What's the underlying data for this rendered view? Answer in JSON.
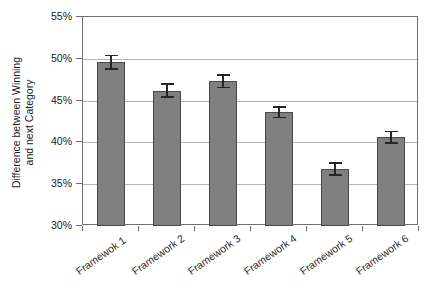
{
  "chart_data": {
    "type": "bar",
    "title": "",
    "subtitle": "",
    "xlabel": "",
    "ylabel": "Difference between Winning and next Category",
    "ylabel_lines": [
      "Difference between Winning",
      "and next Category"
    ],
    "categories": [
      "Framewok 1",
      "Framework 2",
      "Framework 3",
      "Framework 4",
      "Framework 5",
      "Framework 6"
    ],
    "values": [
      49.6,
      46.2,
      47.3,
      43.6,
      36.8,
      40.6
    ],
    "errors": [
      0.9,
      0.9,
      0.85,
      0.7,
      0.8,
      0.8
    ],
    "value_labels": [
      "49.6%",
      "46.2%",
      "47.3%",
      "43.6%",
      "36.8%",
      "40.6%"
    ],
    "ylim": [
      30,
      55
    ],
    "ytick_values": [
      30,
      35,
      40,
      45,
      50,
      55
    ],
    "ytick_labels": [
      "30%",
      "35%",
      "40%",
      "45%",
      "50%",
      "55%"
    ],
    "grid": true,
    "legend": null,
    "legend_position": "none",
    "series": [
      {
        "name": "Difference between Winning and next Category",
        "values": [
          49.6,
          46.2,
          47.3,
          43.6,
          36.8,
          40.6
        ],
        "errors": [
          0.9,
          0.9,
          0.85,
          0.7,
          0.8,
          0.8
        ]
      }
    ],
    "bar_color": "#808080",
    "bar_border_color": "#4a4a4a",
    "error_bar_color": "#262626",
    "grid_color": "#b6b6b6",
    "axis_color": "#6e6e6e",
    "background_color": "#ffffff"
  }
}
